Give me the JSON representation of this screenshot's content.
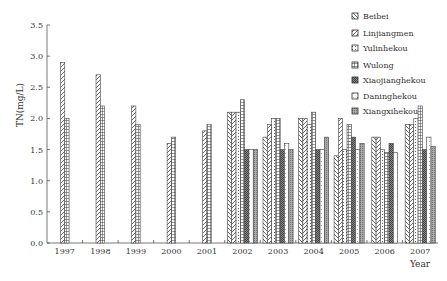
{
  "chart_data": {
    "type": "bar",
    "title": "",
    "xlabel": "Year",
    "ylabel": "TN(mg/L)",
    "ylim": [
      0,
      3.5
    ],
    "yticks": [
      "0.0",
      "0.5",
      "1.0",
      "1.5",
      "2.0",
      "2.5",
      "3.0",
      "3.5"
    ],
    "grid": false,
    "legend_position": "upper right",
    "categories": [
      "1997",
      "1998",
      "1999",
      "2000",
      "2001",
      "2002",
      "2003",
      "2004",
      "2005",
      "2006",
      "2007"
    ],
    "series": [
      {
        "name": "Beibei",
        "pattern": "backslash",
        "values": [
          null,
          null,
          null,
          null,
          null,
          2.1,
          1.7,
          2.0,
          1.4,
          1.7,
          1.9
        ]
      },
      {
        "name": "Linjiangmen",
        "pattern": "slash",
        "values": [
          2.9,
          2.7,
          2.2,
          1.6,
          1.8,
          2.1,
          1.9,
          2.0,
          2.0,
          1.7,
          1.9
        ]
      },
      {
        "name": "Yulinhekou",
        "pattern": "dots",
        "values": [
          null,
          null,
          null,
          null,
          null,
          2.1,
          2.0,
          1.9,
          1.5,
          1.5,
          2.0
        ]
      },
      {
        "name": "Wulong",
        "pattern": "grid",
        "values": [
          2.0,
          2.2,
          1.9,
          1.7,
          1.9,
          2.3,
          2.0,
          2.1,
          1.9,
          1.45,
          2.2
        ]
      },
      {
        "name": "Xiaojianghekou",
        "pattern": "dense",
        "values": [
          null,
          null,
          null,
          null,
          null,
          1.5,
          1.5,
          1.5,
          1.7,
          1.6,
          1.5
        ]
      },
      {
        "name": "Daninghekou",
        "pattern": "light",
        "values": [
          null,
          null,
          null,
          null,
          null,
          1.5,
          1.6,
          1.5,
          1.5,
          1.45,
          1.7
        ]
      },
      {
        "name": "Xiangxihekou",
        "pattern": "medium",
        "values": [
          null,
          null,
          null,
          null,
          null,
          1.5,
          1.5,
          1.7,
          1.6,
          null,
          1.55
        ]
      }
    ]
  },
  "axis": {
    "y_title": "TN(mg/L)",
    "x_title": "Year"
  },
  "legend": {
    "items": [
      "Beibei",
      "Linjiangmen",
      "Yulinhekou",
      "Wulong",
      "Xiaojianghekou",
      "Daninghekou",
      "Xiangxihekou"
    ]
  }
}
